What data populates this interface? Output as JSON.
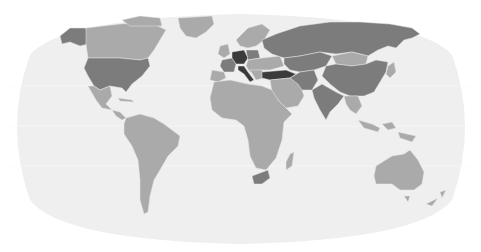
{
  "map": {
    "type": "choropleth",
    "projection": "robinson",
    "title": "",
    "legend": null,
    "colors": {
      "background": "#ffffff",
      "ocean": "#efefef",
      "graticule": "#f8f8f8",
      "border": "#e6e6e6",
      "level_0_nodata": "#d9d9d9",
      "level_1_light": "#aaaaaa",
      "level_2_dark": "#7c7c7c",
      "level_3_darkest": "#3b3b3b"
    },
    "regions": [
      {
        "name": "Canada",
        "level": 1
      },
      {
        "name": "United States",
        "level": 2
      },
      {
        "name": "Mexico",
        "level": 1
      },
      {
        "name": "Central America",
        "level": 1
      },
      {
        "name": "Greenland",
        "level": 1
      },
      {
        "name": "Alaska",
        "level": 2
      },
      {
        "name": "South America",
        "level": 1
      },
      {
        "name": "Africa",
        "level": 1
      },
      {
        "name": "South Africa",
        "level": 2
      },
      {
        "name": "Madagascar",
        "level": 1
      },
      {
        "name": "Western Europe",
        "level": 1
      },
      {
        "name": "France",
        "level": 2
      },
      {
        "name": "Germany",
        "level": 3
      },
      {
        "name": "Italy",
        "level": 3
      },
      {
        "name": "Poland",
        "level": 2
      },
      {
        "name": "Scandinavia",
        "level": 1
      },
      {
        "name": "Ukraine",
        "level": 1
      },
      {
        "name": "Turkey",
        "level": 3
      },
      {
        "name": "Russia",
        "level": 2
      },
      {
        "name": "Kazakhstan / Central Asia",
        "level": 2
      },
      {
        "name": "Middle East",
        "level": 1
      },
      {
        "name": "Iran",
        "level": 2
      },
      {
        "name": "India",
        "level": 2
      },
      {
        "name": "China",
        "level": 2
      },
      {
        "name": "Mongolia",
        "level": 1
      },
      {
        "name": "Southeast Asia",
        "level": 1
      },
      {
        "name": "Indonesia",
        "level": 1
      },
      {
        "name": "Japan",
        "level": 1
      },
      {
        "name": "Australia",
        "level": 1
      },
      {
        "name": "New Zealand",
        "level": 1
      }
    ]
  }
}
